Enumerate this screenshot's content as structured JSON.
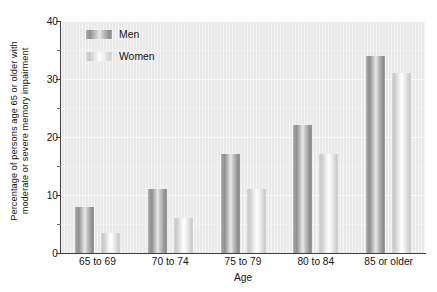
{
  "chart_data": {
    "type": "bar",
    "title": "",
    "subtitle": "",
    "xlabel": "Age",
    "ylabel": "Percentage of persons age 65 or older with moderate or severe memory impairment",
    "ylabel_lines": [
      "Percentage of persons age 65 or older with",
      "moderate or severe memory impairment"
    ],
    "categories": [
      "65 to 69",
      "70 to 74",
      "75 to 79",
      "80 to 84",
      "85 or older"
    ],
    "series": [
      {
        "name": "Men",
        "values": [
          8,
          11,
          17,
          22,
          34
        ],
        "color": "#9a9a9a"
      },
      {
        "name": "Women",
        "values": [
          3.5,
          6,
          11,
          17,
          31
        ],
        "color": "#f0f0f0"
      }
    ],
    "ylim": [
      0,
      40
    ],
    "yticks": [
      0,
      10,
      20,
      30,
      40
    ],
    "ytick_labels": [
      "0",
      "10",
      "20",
      "30",
      "40"
    ],
    "yminor_ticks": [
      5,
      15,
      25,
      35
    ],
    "grid": true,
    "grid_axis": "y",
    "legend_position": "upper left",
    "plot_background": "#e9e9e9",
    "figure_background": "#ffffff"
  },
  "legend": {
    "entries": [
      {
        "label": "Men",
        "swatch": "men-swatch"
      },
      {
        "label": "Women",
        "swatch": "women-swatch"
      }
    ]
  },
  "axes": {
    "x_title": "Age",
    "y_title_line1": "Percentage of persons age 65 or older with",
    "y_title_line2": "moderate or severe memory impairment"
  }
}
